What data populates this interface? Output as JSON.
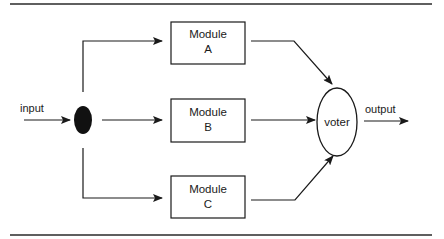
{
  "diagram": {
    "type": "triple-modular-redundancy",
    "input_label": "input",
    "output_label": "output",
    "voter_label": "voter",
    "modules": [
      {
        "line1": "Module",
        "line2": "A"
      },
      {
        "line1": "Module",
        "line2": "B"
      },
      {
        "line1": "Module",
        "line2": "C"
      }
    ],
    "colors": {
      "ink": "#1a1a1a",
      "background": "#ffffff"
    }
  }
}
